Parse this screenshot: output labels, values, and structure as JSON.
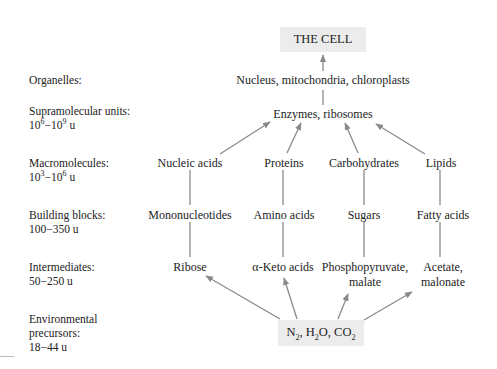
{
  "diagram": {
    "title_box": "THE CELL",
    "source_box": {
      "parts": [
        "N",
        "2",
        ", H",
        "2",
        "O, CO",
        "2"
      ],
      "text": "N2, H2O, CO2"
    },
    "levels": [
      {
        "id": "organelles",
        "label_line1": "Organelles:",
        "label_line2": ""
      },
      {
        "id": "supramolecular",
        "label_line1": "Supramolecular units:",
        "range": {
          "a": "10",
          "a_exp": "6",
          "b": "10",
          "b_exp": "9",
          "unit": "u"
        }
      },
      {
        "id": "macromolecules",
        "label_line1": "Macromolecules:",
        "range": {
          "a": "10",
          "a_exp": "3",
          "b": "10",
          "b_exp": "6",
          "unit": "u"
        }
      },
      {
        "id": "building_blocks",
        "label_line1": "Building blocks:",
        "label_line2": "100−350 u"
      },
      {
        "id": "intermediates",
        "label_line1": "Intermediates:",
        "label_line2": "50−250 u"
      },
      {
        "id": "environmental",
        "label_line1": "Environmental",
        "label_line2": "precursors:",
        "label_line3": "18−44 u"
      }
    ],
    "organelles": "Nucleus, mitochondria, chloroplasts",
    "supramolecular": "Enzymes, ribosomes",
    "macromolecules": [
      "Nucleic acids",
      "Proteins",
      "Carbohydrates",
      "Lipids"
    ],
    "building_blocks": [
      "Mononucleotides",
      "Amino acids",
      "Sugars",
      "Fatty acids"
    ],
    "intermediates": [
      {
        "line1": "Ribose",
        "line2": ""
      },
      {
        "line1": "α-Keto acids",
        "line2": ""
      },
      {
        "line1": "Phosphopyruvate,",
        "line2": "malate"
      },
      {
        "line1": "Acetate,",
        "line2": "malonate"
      }
    ],
    "colors": {
      "box_fill": "#ececec",
      "arrow": "#8a8a8a",
      "text": "#222222"
    }
  }
}
